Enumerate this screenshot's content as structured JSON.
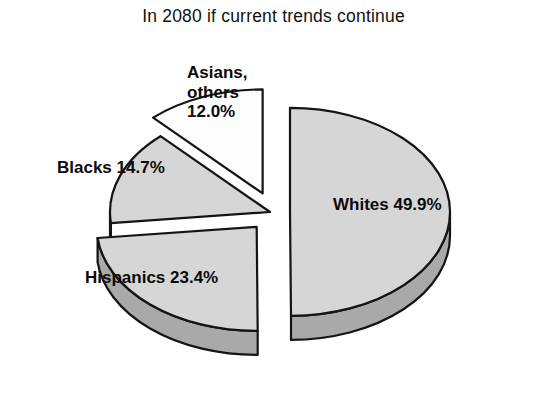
{
  "chart_data": {
    "type": "pie",
    "title": "In 2080 if current trends continue",
    "style": "3d-exploded",
    "categories": [
      "Whites",
      "Hispanics",
      "Blacks",
      "Asians, others"
    ],
    "values": [
      49.9,
      23.4,
      14.7,
      12.0
    ],
    "value_unit": "%",
    "total": 100.0,
    "labels": [
      "Whites 49.9%",
      "Hispanics 23.4%",
      "Blacks 14.7%",
      "Asians,\nothers\n12.0%"
    ],
    "slices": [
      {
        "name": "Whites",
        "value": 49.9,
        "label": "Whites 49.9%",
        "fill": "#d6d6d6",
        "side_fill": "#a9a9a9",
        "exploded": true
      },
      {
        "name": "Hispanics",
        "value": 23.4,
        "label": "Hispanics 23.4%",
        "fill": "#d6d6d6",
        "side_fill": "#a9a9a9",
        "exploded": true
      },
      {
        "name": "Blacks",
        "value": 14.7,
        "label": "Blacks 14.7%",
        "fill": "#d6d6d6",
        "side_fill": "#a9a9a9",
        "exploded": false
      },
      {
        "name": "Asians, others",
        "value": 12.0,
        "label": "Asians,\nothers\n12.0%",
        "fill": "#fdfdfd",
        "side_fill": "#d0d0d0",
        "exploded": true
      }
    ],
    "legend": "none",
    "grid": false,
    "background": "#ffffff",
    "outline_color": "#141414"
  }
}
